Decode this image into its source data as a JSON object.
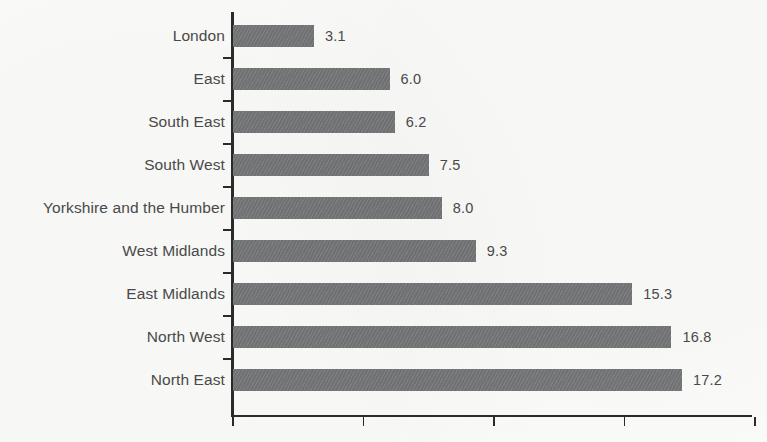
{
  "chart_data": {
    "type": "bar",
    "orientation": "horizontal",
    "title": "",
    "subtitle": "",
    "xlabel": "",
    "ylabel": "",
    "categories": [
      "London",
      "East",
      "South East",
      "South West",
      "Yorkshire and the Humber",
      "West Midlands",
      "East Midlands",
      "North West",
      "North East"
    ],
    "values": [
      3.1,
      6.0,
      6.2,
      7.5,
      8.0,
      9.3,
      15.3,
      16.8,
      17.2
    ],
    "value_labels": [
      "3.1",
      "6.0",
      "6.2",
      "7.5",
      "8.0",
      "9.3",
      "15.3",
      "16.8",
      "17.2"
    ],
    "xlim": [
      0,
      19.9
    ],
    "xticks": [
      0,
      5,
      10,
      15,
      20
    ],
    "xtick_labels": [
      "",
      "",
      "",
      "",
      ""
    ],
    "grid": false,
    "legend": false,
    "legend_position": "none",
    "series": [
      {
        "name": "",
        "values": [
          3.1,
          6.0,
          6.2,
          7.5,
          8.0,
          9.3,
          15.3,
          16.8,
          17.2
        ]
      }
    ],
    "colors": {
      "bar_fill": "#77787a",
      "axis": "#2b2b2b",
      "label_text": "#4a4a4a",
      "background": "#fbfbf9"
    }
  }
}
